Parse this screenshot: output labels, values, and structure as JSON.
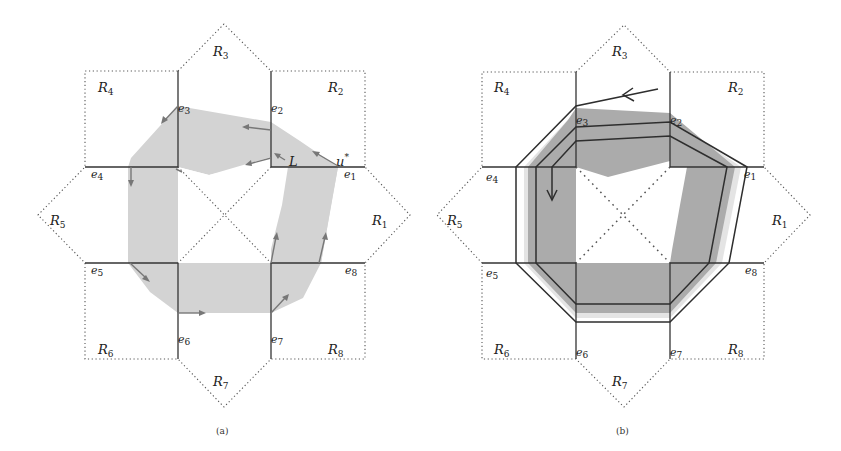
{
  "figure": {
    "panels": [
      {
        "id": "a",
        "caption": "(a)",
        "regions": {
          "R1": "R",
          "R2": "R",
          "R3": "R",
          "R4": "R",
          "R5": "R",
          "R6": "R",
          "R7": "R",
          "R8": "R"
        },
        "region_labels": [
          {
            "name": "R",
            "sub": "1"
          },
          {
            "name": "R",
            "sub": "2"
          },
          {
            "name": "R",
            "sub": "3"
          },
          {
            "name": "R",
            "sub": "4"
          },
          {
            "name": "R",
            "sub": "5"
          },
          {
            "name": "R",
            "sub": "6"
          },
          {
            "name": "R",
            "sub": "7"
          },
          {
            "name": "R",
            "sub": "8"
          }
        ],
        "edge_labels": [
          {
            "name": "e",
            "sub": "1"
          },
          {
            "name": "e",
            "sub": "2"
          },
          {
            "name": "e",
            "sub": "3"
          },
          {
            "name": "e",
            "sub": "4"
          },
          {
            "name": "e",
            "sub": "5"
          },
          {
            "name": "e",
            "sub": "6"
          },
          {
            "name": "e",
            "sub": "7"
          },
          {
            "name": "e",
            "sub": "8"
          }
        ],
        "annotations": {
          "L": "L",
          "u_star": "u",
          "star": "*"
        }
      },
      {
        "id": "b",
        "caption": "(b)",
        "region_labels": [
          {
            "name": "R",
            "sub": "1"
          },
          {
            "name": "R",
            "sub": "2"
          },
          {
            "name": "R",
            "sub": "3"
          },
          {
            "name": "R",
            "sub": "4"
          },
          {
            "name": "R",
            "sub": "5"
          },
          {
            "name": "R",
            "sub": "6"
          },
          {
            "name": "R",
            "sub": "7"
          },
          {
            "name": "R",
            "sub": "8"
          }
        ],
        "edge_labels": [
          {
            "name": "e",
            "sub": "1"
          },
          {
            "name": "e",
            "sub": "2"
          },
          {
            "name": "e",
            "sub": "3"
          },
          {
            "name": "e",
            "sub": "4"
          },
          {
            "name": "e",
            "sub": "5"
          },
          {
            "name": "e",
            "sub": "6"
          },
          {
            "name": "e",
            "sub": "7"
          },
          {
            "name": "e",
            "sub": "8"
          }
        ]
      }
    ],
    "colors": {
      "shade_light": "#d2d2d2",
      "shade_dark": "#a9a9a9",
      "shade_b_light": "#cfcfcf",
      "line": "#333333",
      "arrow": "#777777"
    }
  }
}
